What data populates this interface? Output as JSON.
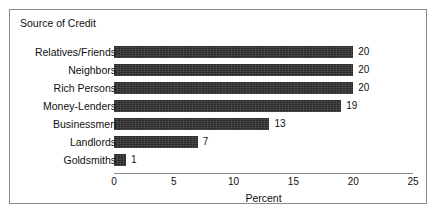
{
  "chart_data": {
    "type": "bar",
    "orientation": "horizontal",
    "title": "Source of Credit",
    "xlabel": "Percent",
    "ylabel": "",
    "xlim": [
      0,
      25
    ],
    "xticks": [
      0,
      5,
      10,
      15,
      20,
      25
    ],
    "xtick_labels": [
      "0",
      "5",
      "10",
      "15",
      "20",
      "25"
    ],
    "grid": false,
    "legend": null,
    "bar_color": "#2b2b2b",
    "frame_color": "#8a8a8a",
    "background_color": "#ffffff",
    "categories": [
      "Relatives/Friends",
      "Neighbors",
      "Rich Persons",
      "Money-Lenders",
      "Businessmen",
      "Landlords",
      "Goldsmiths"
    ],
    "values": [
      20,
      20,
      20,
      19,
      13,
      7,
      1
    ],
    "value_labels": [
      "20",
      "20",
      "20",
      "19",
      "13",
      "7",
      "1"
    ]
  }
}
